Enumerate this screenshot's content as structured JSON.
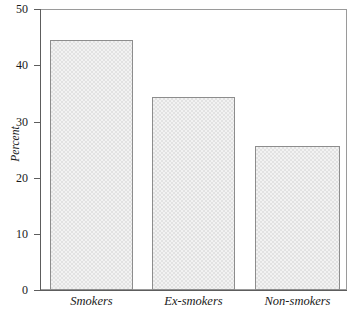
{
  "chart_data": {
    "type": "bar",
    "title": "",
    "subtitle": "",
    "xlabel": "",
    "ylabel": "Percent",
    "categories": [
      "Smokers",
      "Ex-smokers",
      "Non-smokers"
    ],
    "values": [
      44.5,
      34.3,
      25.7
    ],
    "ylim": [
      0,
      50
    ],
    "yticks": [
      0,
      10,
      20,
      30,
      40,
      50
    ],
    "ytick_labels": [
      "0",
      "10",
      "20",
      "30",
      "40",
      "50"
    ],
    "grid": false,
    "legend": null,
    "legend_position": "none",
    "bar_fill_color": "#efefef",
    "bar_edge_color": "#8d8d8d",
    "axis_color": "#5d5d5d",
    "background_color": "#ffffff",
    "annotations": []
  },
  "caption": {
    "partial_text": ""
  }
}
